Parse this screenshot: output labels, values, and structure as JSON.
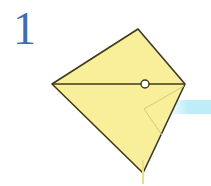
{
  "step": {
    "number": "1"
  },
  "diagram": {
    "shape": "kite",
    "colors": {
      "paper": "#f9ef9a",
      "outline": "#3d3a1e",
      "fold_line": "#d6c877",
      "step_number": "#3a6fb5",
      "accent_band": "#bdeef8"
    },
    "vertices": {
      "top": [
        138,
        29
      ],
      "left": [
        52,
        84
      ],
      "right": [
        185,
        84
      ],
      "bottom": [
        143,
        173
      ]
    },
    "fold_point": [
      145,
      84
    ],
    "inner_fold": [
      [
        184,
        86
      ],
      [
        144,
        109
      ],
      [
        162,
        135
      ]
    ]
  }
}
